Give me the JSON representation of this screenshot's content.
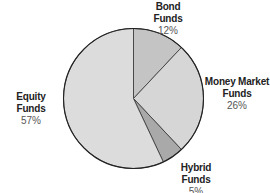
{
  "chart_data": {
    "type": "pie",
    "title": "",
    "categories": [
      "Bond Funds",
      "Money Market Funds",
      "Hybrid Funds",
      "Equity Funds"
    ],
    "values": [
      12,
      26,
      5,
      57
    ],
    "labels": [
      "12%",
      "26%",
      "5%",
      "57%"
    ],
    "colors": [
      "#c4c4c4",
      "#d6d6d6",
      "#a9a9a9",
      "#dcdcdc"
    ],
    "start_angle_deg": 0,
    "direction": "clockwise",
    "legend": "none"
  },
  "labels": {
    "bond": {
      "name": "Bond Funds",
      "pct": "12%"
    },
    "money_market": {
      "name_line1": "Money Market",
      "name_line2": "Funds",
      "pct": "26%"
    },
    "hybrid": {
      "name": "Hybrid Funds",
      "pct": "5%"
    },
    "equity": {
      "name": "Equity Funds",
      "pct": "57%"
    }
  }
}
